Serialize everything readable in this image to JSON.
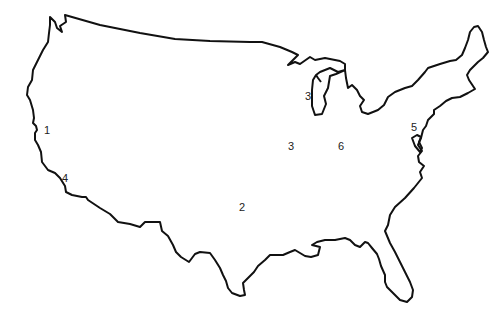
{
  "map": {
    "title": "Outline map of the contiguous United States",
    "outline_color": "#111111",
    "background": "#ffffff",
    "labels": [
      {
        "text": "1",
        "x": 44,
        "y": 125
      },
      {
        "text": "4",
        "x": 62,
        "y": 173
      },
      {
        "text": "2",
        "x": 239,
        "y": 202
      },
      {
        "text": "3",
        "x": 305,
        "y": 91
      },
      {
        "text": "3",
        "x": 288,
        "y": 141
      },
      {
        "text": "6",
        "x": 338,
        "y": 141
      },
      {
        "text": "5",
        "x": 411,
        "y": 122
      }
    ]
  }
}
